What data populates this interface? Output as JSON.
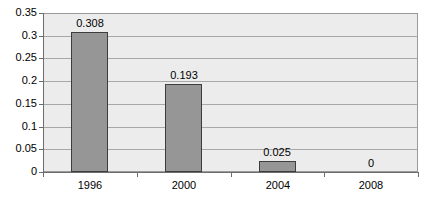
{
  "chart_data": {
    "type": "bar",
    "title": "",
    "subtitle": "",
    "xlabel": "",
    "ylabel": "",
    "categories": [
      "1996",
      "2000",
      "2004",
      "2008"
    ],
    "values": [
      0.308,
      0.193,
      0.025,
      0
    ],
    "data_labels": [
      "0.308",
      "0.193",
      "0.025",
      "0"
    ],
    "ylim": [
      0,
      0.35
    ],
    "ytick_values": [
      0,
      0.05,
      0.1,
      0.15,
      0.2,
      0.25,
      0.3,
      0.35
    ],
    "ytick_labels": [
      "0",
      "0.05",
      "0.1",
      "0.15",
      "0.2",
      "0.25",
      "0.3",
      "0.35"
    ],
    "grid": true,
    "grid_axis": "y",
    "legend": false,
    "legend_position": "none",
    "series": [
      {
        "name": "",
        "values": [
          0.308,
          0.193,
          0.025,
          0
        ]
      }
    ],
    "colors": {
      "bar_fill": "#969696",
      "bar_border": "#3d3d3d",
      "plot_background": "#ececec",
      "plot_border": "#9a9a9a",
      "gridline": "#a8a8a8",
      "axis": "#6d6d6d",
      "text": "#000000",
      "page_background": "#ffffff"
    }
  }
}
